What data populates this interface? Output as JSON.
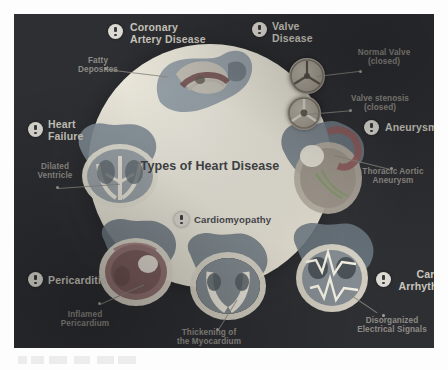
{
  "page": {
    "background_color": "#fdfdfd",
    "panel_color": "#2e2f33"
  },
  "infographic": {
    "center": {
      "title": "Types of Heart\nDisease",
      "disc_color": "#e7e3d6",
      "title_color": "#3b3c40"
    },
    "label_color": "#c9c6bd",
    "annotation_color": "#8e8c86",
    "badge_color": "#dcdad2",
    "diseases": [
      {
        "id": "coronary-artery-disease",
        "label": "Coronary\nArtery Disease",
        "badge": "alert-icon"
      },
      {
        "id": "valve-disease",
        "label": "Valve\nDisease",
        "badge": "alert-icon"
      },
      {
        "id": "aneurysm",
        "label": "Aneurysm",
        "badge": "alert-icon"
      },
      {
        "id": "cardiac-arrhythmia",
        "label": "Cardiac\nArrhythmia",
        "badge": "alert-icon"
      },
      {
        "id": "pericarditis",
        "label": "Pericarditis",
        "badge": "alert-icon"
      },
      {
        "id": "heart-failure",
        "label": "Heart\nFailure",
        "badge": "alert-icon"
      },
      {
        "id": "cardiomyopathy",
        "label": "Cardiomyopathy",
        "badge": "alert-icon"
      }
    ],
    "annotations": [
      {
        "id": "fatty-deposites",
        "text": "Fatty\nDeposites"
      },
      {
        "id": "normal-valve",
        "text": "Normal Valve\n(closed)"
      },
      {
        "id": "valve-stenosis",
        "text": "Valve stenosis\n(closed)"
      },
      {
        "id": "thoracic-aortic-aneurysm",
        "text": "Thoracic Aortic\nAneurysm"
      },
      {
        "id": "dilated-ventricle",
        "text": "Dilated\nVentricle"
      },
      {
        "id": "inflamed-pericardium",
        "text": "Inflamed\nPericardium"
      },
      {
        "id": "thickening-of-the-myocardium",
        "text": "Thickening of\nthe Myocardium"
      },
      {
        "id": "disorganized-electrical-signals",
        "text": "Disorganized\nElectrical Signals"
      }
    ]
  }
}
